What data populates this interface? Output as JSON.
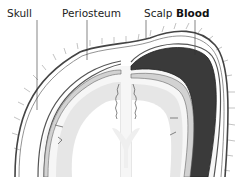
{
  "diagram": {
    "labels": [
      {
        "id": "skull",
        "text": "Skull",
        "bold": false
      },
      {
        "id": "periosteum",
        "text": "Periosteum",
        "bold": false
      },
      {
        "id": "scalp",
        "text": "Scalp",
        "bold": false
      },
      {
        "id": "blood",
        "text": "Blood",
        "bold": true
      }
    ],
    "colors": {
      "blood": "#3a3a3a",
      "skull_line": "#555555",
      "brain_fill": "#e6e6e6",
      "bone_fill": "#d2d2d2",
      "background": "#ffffff"
    }
  }
}
